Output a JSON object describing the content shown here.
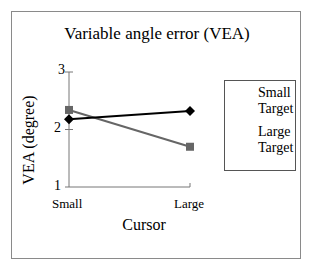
{
  "chart_data": {
    "type": "line",
    "title": "Variable angle error (VEA)",
    "xlabel": "Cursor",
    "ylabel": "VEA (degree)",
    "categories": [
      "Small",
      "Large"
    ],
    "series": [
      {
        "name": "Small Target",
        "marker": "diamond",
        "color": "#000000",
        "values": [
          2.18,
          2.32
        ]
      },
      {
        "name": "Large Target",
        "marker": "square",
        "color": "#666666",
        "values": [
          2.34,
          1.7
        ]
      }
    ],
    "ylim": [
      1,
      3
    ],
    "yticks": [
      1,
      2,
      3
    ],
    "grid": false,
    "legend_position": "right"
  },
  "labels": {
    "title": "Variable angle error (VEA)",
    "ylabel": "VEA (degree)",
    "xlabel": "Cursor",
    "yticks": [
      "3",
      "2",
      "1"
    ],
    "xticks": [
      "Small",
      "Large"
    ],
    "legend": [
      {
        "line1": "Small",
        "line2": "Target"
      },
      {
        "line1": "Large",
        "line2": "Target"
      }
    ]
  }
}
